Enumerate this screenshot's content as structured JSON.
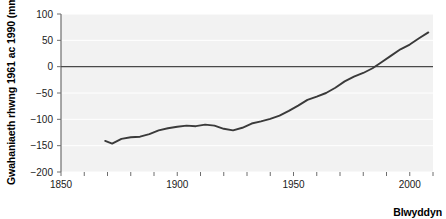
{
  "chart_data": {
    "type": "line",
    "title": "",
    "xlabel": "Blwyddyn",
    "ylabel": "Gwahaniaeth rhwng 1961 ac 1990 (mm)",
    "xlim": [
      1850,
      2010
    ],
    "ylim": [
      -200,
      100
    ],
    "x_ticks": [
      1850,
      1860,
      1870,
      1880,
      1890,
      1900,
      1910,
      1920,
      1930,
      1940,
      1950,
      1960,
      1970,
      1980,
      1990,
      2000,
      2010
    ],
    "x_tick_labels": [
      "1850",
      "",
      "",
      "",
      "",
      "1900",
      "",
      "",
      "",
      "",
      "1950",
      "",
      "",
      "",
      "",
      "2000",
      ""
    ],
    "y_ticks": [
      100,
      50,
      0,
      -50,
      -100,
      -150,
      -200
    ],
    "y_tick_labels": [
      "100",
      "50",
      "0",
      "−50",
      "−100",
      "−150",
      "−200"
    ],
    "grid": true,
    "grid_axis": "y",
    "legend": null,
    "zero_line": 0,
    "series": [
      {
        "name": "Gwahaniaeth glawiad",
        "color": "#3a3a3a",
        "x": [
          1869,
          1872,
          1876,
          1880,
          1884,
          1888,
          1892,
          1896,
          1900,
          1904,
          1908,
          1912,
          1916,
          1920,
          1924,
          1928,
          1932,
          1936,
          1940,
          1944,
          1948,
          1952,
          1956,
          1960,
          1964,
          1968,
          1972,
          1976,
          1980,
          1984,
          1988,
          1992,
          1996,
          2000,
          2004,
          2008
        ],
        "values": [
          -141,
          -146,
          -137,
          -134,
          -133,
          -128,
          -121,
          -117,
          -114,
          -112,
          -113,
          -110,
          -112,
          -118,
          -121,
          -116,
          -108,
          -104,
          -99,
          -93,
          -84,
          -74,
          -63,
          -57,
          -50,
          -40,
          -28,
          -19,
          -12,
          -3,
          9,
          21,
          33,
          42,
          54,
          65
        ]
      }
    ]
  },
  "plot_area": {
    "left": 61,
    "top": 14,
    "right": 433,
    "bottom": 172,
    "background": "#f2f2f2",
    "gridline_color": "#ffffff",
    "axis_color": "#6e6e6e",
    "zero_line_color": "#4a4a4a"
  }
}
